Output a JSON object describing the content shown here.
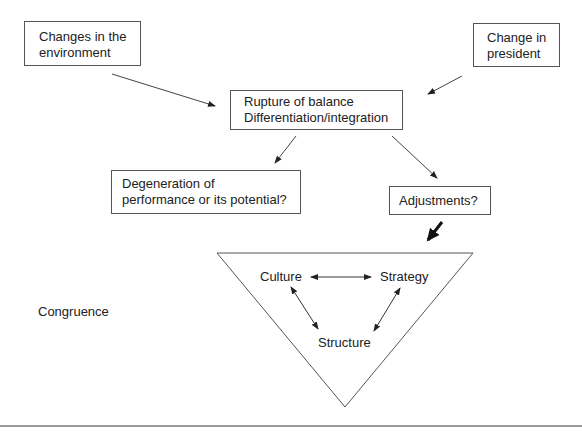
{
  "diagram": {
    "boxes": {
      "env": {
        "line1": "Changes in the",
        "line2": "environment"
      },
      "president": {
        "line1": "Change in",
        "line2": "president"
      },
      "rupture": {
        "line1": "Rupture of balance",
        "line2": "Differentiation/integration"
      },
      "degeneration": {
        "line1": "Degeneration of",
        "line2": "performance or its potential?"
      },
      "adjustments": {
        "line1": "Adjustments?"
      }
    },
    "triangle": {
      "culture": "Culture",
      "strategy": "Strategy",
      "structure": "Structure"
    },
    "congruence_label": "Congruence",
    "colors": {
      "line": "#555555",
      "text": "#222222",
      "bold_arrow": "#111111"
    }
  }
}
